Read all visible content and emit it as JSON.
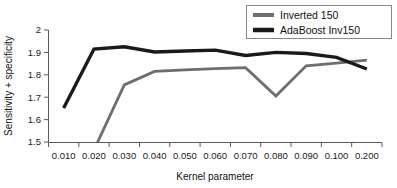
{
  "chart_data": {
    "type": "line",
    "title": "",
    "xlabel": "Kernel parameter",
    "ylabel": "Sensitivity + specificity",
    "categories": [
      "0.010",
      "0.020",
      "0.030",
      "0.040",
      "0.050",
      "0.060",
      "0.070",
      "0.080",
      "0.090",
      "0.100",
      "0.200"
    ],
    "ytick_labels": [
      "1.5",
      "1.6",
      "1.7",
      "1.8",
      "1.9",
      "2"
    ],
    "ylim": [
      1.5,
      2.0
    ],
    "grid": false,
    "legend_position": "top-right",
    "series": [
      {
        "name": "Inverted 150",
        "color": "#6e6e6e",
        "values": [
          null,
          1.5,
          1.755,
          1.815,
          1.822,
          1.828,
          1.832,
          1.705,
          1.84,
          1.852,
          1.866
        ],
        "note_clipped_below_axis": true
      },
      {
        "name": "AdaBoost Inv150",
        "color": "#1a1a1a",
        "values": [
          1.652,
          1.915,
          1.925,
          1.902,
          1.906,
          1.91,
          1.886,
          1.9,
          1.895,
          1.878,
          1.826
        ]
      }
    ]
  },
  "legend": {
    "entries": [
      {
        "label": "Inverted 150",
        "swatch": "gray-line-swatch"
      },
      {
        "label": "AdaBoost Inv150",
        "swatch": "black-line-swatch"
      }
    ]
  },
  "colors": {
    "series_gray": "#6e6e6e",
    "series_black": "#1a1a1a",
    "axis": "#5a5a5a",
    "legend_border": "#8a8a8a",
    "background": "#ffffff"
  }
}
